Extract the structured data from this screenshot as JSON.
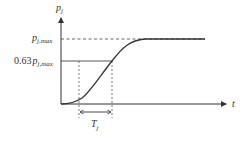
{
  "diagram": {
    "type": "step-response-curve",
    "y_axis": {
      "label_main": "p",
      "label_sub": "j"
    },
    "x_axis": {
      "label": "t"
    },
    "max_level": {
      "label_main": "p",
      "label_sub": "j,max"
    },
    "mid_level": {
      "prefix": "0.63",
      "label_main": "p",
      "label_sub": "j,max"
    },
    "time_constant": {
      "label_main": "T",
      "label_sub": "j"
    },
    "colors": {
      "line": "#333333",
      "dashed": "#555555",
      "background": "#ffffff"
    }
  }
}
